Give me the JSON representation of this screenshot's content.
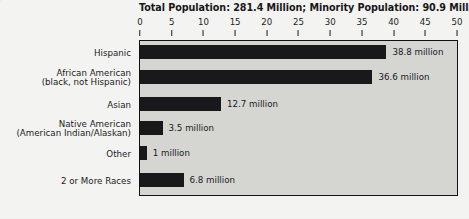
{
  "chart_data": {
    "type": "bar",
    "orientation": "horizontal",
    "title": "Total Population: 281.4 Million; Minority Population: 90.9 Million",
    "xlabel": "",
    "ylabel": "",
    "xlim": [
      0,
      50
    ],
    "xticks": [
      0,
      5,
      10,
      15,
      20,
      25,
      30,
      35,
      40,
      45,
      50
    ],
    "xtick_labels": [
      "0",
      "5",
      "10",
      "15",
      "20",
      "25",
      "30",
      "35",
      "40",
      "45",
      "50"
    ],
    "grid": false,
    "legend": false,
    "units": "million",
    "bar_color": "#19191b",
    "plot_background": "#d5d5d2",
    "figure_background": "#f3f3f1",
    "frame_color": "#121214",
    "categories": [
      "Hispanic",
      "African American (black, not Hispanic)",
      "Asian",
      "Native American (American Indian/Alaskan)",
      "Other",
      "2 or More Races"
    ],
    "category_lines": [
      [
        "Hispanic"
      ],
      [
        "African American",
        "(black, not Hispanic)"
      ],
      [
        "Asian"
      ],
      [
        "Native American",
        "(American Indian/Alaskan)"
      ],
      [
        "Other"
      ],
      [
        "2 or More Races"
      ]
    ],
    "values": [
      38.8,
      36.6,
      12.7,
      3.5,
      1.0,
      6.8
    ],
    "value_labels": [
      "38.8 million",
      "36.6 million",
      "12.7 million",
      "3.5 million",
      "1 million",
      "6.8 million"
    ],
    "totals": {
      "total_population_label": "Total Population:",
      "total_population_value": "281.4 Million",
      "minority_population_label": "Minority Population:",
      "minority_population_value": "90.9 Million"
    }
  }
}
